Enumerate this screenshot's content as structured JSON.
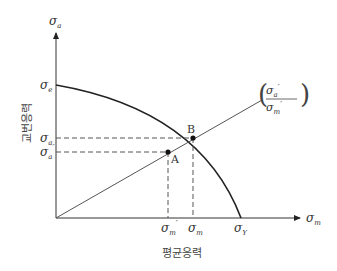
{
  "diagram": {
    "type": "fatigue-diagram",
    "y_axis": {
      "symbol": "σ",
      "subscript": "a",
      "title": "교번응력"
    },
    "x_axis": {
      "symbol": "σ",
      "subscript": "m",
      "title": "평균응력"
    },
    "y_ticks": [
      {
        "symbol": "σ",
        "subscript": "e",
        "prime": ""
      },
      {
        "symbol": "σ",
        "subscript": "a",
        "prime": ""
      },
      {
        "symbol": "σ",
        "subscript": "a",
        "prime": "′"
      }
    ],
    "x_ticks": [
      {
        "symbol": "σ",
        "subscript": "m",
        "prime": "′"
      },
      {
        "symbol": "σ",
        "subscript": "m",
        "prime": ""
      },
      {
        "symbol": "σ",
        "subscript": "Y",
        "prime": ""
      }
    ],
    "points": [
      {
        "label": "A"
      },
      {
        "label": "B"
      }
    ],
    "ratio_label": {
      "numerator": {
        "symbol": "σ",
        "subscript": "a",
        "prime": "′"
      },
      "denominator": {
        "symbol": "σ",
        "subscript": "m",
        "prime": "′"
      }
    },
    "colors": {
      "axis": "#333333",
      "curve": "#222222",
      "dashed": "#555555",
      "line": "#555555"
    }
  }
}
